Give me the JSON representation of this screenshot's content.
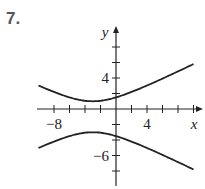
{
  "problem_number": "7.",
  "chart_data": {
    "type": "line",
    "title": "",
    "xlabel": "x",
    "ylabel": "y",
    "xlim": [
      -10.2,
      11
    ],
    "ylim": [
      -9.5,
      10
    ],
    "x_tick_step": 2,
    "y_tick_step": 2,
    "x_tick_labels": [
      {
        "value": -8,
        "label": "−8"
      },
      {
        "value": 4,
        "label": "4"
      }
    ],
    "y_tick_labels": [
      {
        "value": 4,
        "label": "4"
      },
      {
        "value": -6,
        "label": "−6"
      }
    ],
    "grid": false,
    "legend": null,
    "series": [
      {
        "name": "upper-branch",
        "x": [
          -10,
          -8,
          -6,
          -4,
          -3,
          -2,
          0,
          2,
          4,
          6,
          8,
          10
        ],
        "y": [
          3.0,
          2.0,
          1.3,
          1.0,
          1.0,
          1.05,
          1.6,
          2.5,
          3.3,
          4.2,
          5.0,
          5.9
        ]
      },
      {
        "name": "lower-branch",
        "x": [
          -10,
          -8,
          -6,
          -4,
          -3,
          -2,
          0,
          2,
          4,
          6,
          8,
          10
        ],
        "y": [
          -5.2,
          -4.2,
          -3.4,
          -3.0,
          -3.0,
          -3.05,
          -3.6,
          -4.5,
          -5.4,
          -6.3,
          -7.1,
          -7.9
        ]
      }
    ]
  }
}
